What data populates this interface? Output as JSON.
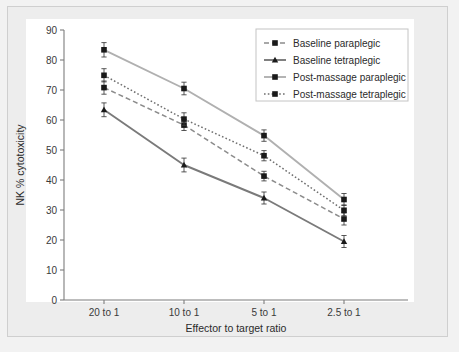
{
  "figure": {
    "background_color": "#ededed",
    "plot_background_color": "#ffffff",
    "frame_border_color": "#cfcfcf"
  },
  "chart_data": {
    "type": "line",
    "title": "",
    "subtitle": "",
    "xlabel": "Effector to target ratio",
    "ylabel": "NK % cytotoxicity",
    "categories": [
      "20 to 1",
      "10 to 1",
      "5 to 1",
      "2.5 to 1"
    ],
    "xtick_labels": [
      "20 to 1",
      "10 to 1",
      "5 to 1",
      "2.5 to 1"
    ],
    "ytick_labels": [
      "0",
      "10",
      "20",
      "30",
      "40",
      "50",
      "60",
      "70",
      "80",
      "90"
    ],
    "ytick_values": [
      0,
      10,
      20,
      30,
      40,
      50,
      60,
      70,
      80,
      90
    ],
    "ylim": [
      0,
      90
    ],
    "grid": false,
    "legend_position": "top-right",
    "error_bar_style": "capped",
    "series": [
      {
        "name": "Baseline paraplegic",
        "linestyle": "dashed",
        "marker": "square",
        "color": "#8c8c8c",
        "marker_color": "#1a1a1a",
        "values": [
          70.8,
          58.3,
          41.3,
          27.0
        ],
        "errors": [
          2.2,
          1.8,
          1.6,
          2.0
        ]
      },
      {
        "name": "Baseline tetraplegic",
        "linestyle": "solid",
        "marker": "triangle",
        "color": "#7a7a7a",
        "marker_color": "#1a1a1a",
        "values": [
          63.4,
          45.0,
          34.0,
          19.5
        ],
        "errors": [
          2.3,
          2.3,
          2.0,
          2.0
        ]
      },
      {
        "name": "Post-massage paraplegic",
        "linestyle": "solid",
        "marker": "square",
        "color": "#b0b0b0",
        "marker_color": "#1a1a1a",
        "values": [
          83.4,
          70.5,
          54.8,
          33.5
        ],
        "errors": [
          2.4,
          2.1,
          1.9,
          2.0
        ]
      },
      {
        "name": "Post-massage tetraplegic",
        "linestyle": "dotted",
        "marker": "square",
        "color": "#6f6f6f",
        "marker_color": "#1a1a1a",
        "values": [
          74.9,
          60.3,
          48.1,
          29.9
        ],
        "errors": [
          2.2,
          2.1,
          1.7,
          1.8
        ]
      }
    ]
  },
  "legend": {
    "items": [
      {
        "label": "Baseline paraplegic"
      },
      {
        "label": "Baseline tetraplegic"
      },
      {
        "label": "Post-massage paraplegic"
      },
      {
        "label": "Post-massage tetraplegic"
      }
    ]
  }
}
